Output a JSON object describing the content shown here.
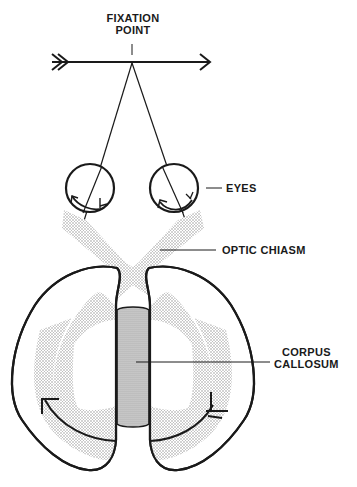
{
  "diagram": {
    "labels": {
      "fixation_line1": "FIXATION",
      "fixation_line2": "POINT",
      "eyes": "EYES",
      "optic_chiasm": "OPTIC CHIASM",
      "corpus_line1": "CORPUS",
      "corpus_line2": "CALLOSUM"
    },
    "colors": {
      "ink": "#1a1a1a",
      "stipple": "#9a9a9a",
      "background": "#ffffff"
    }
  }
}
